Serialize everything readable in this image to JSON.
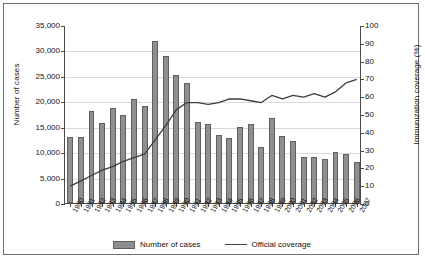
{
  "chart_data": {
    "type": "bar",
    "title": "",
    "xlabel": "",
    "ylabel": "Number of cases",
    "ylabel_right": "Immunization coverage (%)",
    "ylim": [
      0,
      35000
    ],
    "ylim_right": [
      0,
      100
    ],
    "grid": true,
    "legend_position": "bottom-center",
    "categories": [
      "1980",
      "1981",
      "1982",
      "1983",
      "1984",
      "1985",
      "1986",
      "1987",
      "1988",
      "1989",
      "1990",
      "1991",
      "1992",
      "1993",
      "1994",
      "1995",
      "1996",
      "1997",
      "1998",
      "1999",
      "2000",
      "2001",
      "2002",
      "2003",
      "2004",
      "2005",
      "2006",
      "2007"
    ],
    "ytick_labels": [
      "0",
      "5,000",
      "10,000",
      "15,000",
      "20,000",
      "25,000",
      "30,000",
      "35,000"
    ],
    "ytick_values": [
      0,
      5000,
      10000,
      15000,
      20000,
      25000,
      30000,
      35000
    ],
    "ytick_labels_right": [
      "0",
      "10",
      "20",
      "30",
      "40",
      "50",
      "60",
      "70",
      "80",
      "90",
      "100"
    ],
    "ytick_values_right": [
      0,
      10,
      20,
      30,
      40,
      50,
      60,
      70,
      80,
      90,
      100
    ],
    "series": [
      {
        "name": "Number of cases",
        "type": "bar",
        "axis": "left",
        "color": "#8f8f8f",
        "edge_color": "#5f5f5f",
        "values": [
          13000,
          12900,
          18000,
          15800,
          18600,
          17400,
          20500,
          19000,
          31800,
          29000,
          25200,
          23600,
          16000,
          15600,
          13300,
          12800,
          15000,
          15600,
          11000,
          16800,
          13100,
          12100,
          9100,
          9000,
          8600,
          10000,
          9700,
          8100
        ]
      },
      {
        "name": "Official coverage",
        "type": "line",
        "axis": "right",
        "color": "#3d3d3d",
        "values": [
          10,
          13,
          16,
          19,
          21,
          24,
          26,
          28,
          36,
          44,
          53,
          57,
          57,
          56,
          57,
          59,
          59,
          58,
          57,
          61,
          59,
          61,
          60,
          62,
          60,
          63,
          68,
          70
        ]
      }
    ]
  },
  "legend": {
    "items": [
      {
        "label": "Number of cases",
        "marker": "bar-swatch"
      },
      {
        "label": "Official coverage",
        "marker": "line-swatch"
      }
    ]
  }
}
